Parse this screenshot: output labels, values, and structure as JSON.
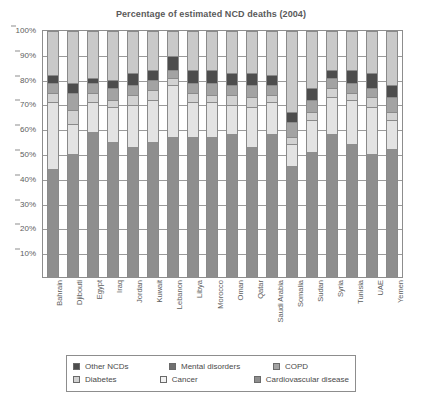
{
  "chart_data": {
    "type": "bar",
    "subtype": "stacked-percentage",
    "title": "Percentage of estimated NCD deaths (2004)",
    "xlabel": "",
    "ylabel": "",
    "ylim": [
      0,
      100
    ],
    "y_tick_labels": [
      "10%",
      "20%",
      "30%",
      "40%",
      "50%",
      "60%",
      "70%",
      "80%",
      "90%",
      "100%"
    ],
    "y_tick_values": [
      10,
      20,
      30,
      40,
      50,
      60,
      70,
      80,
      90,
      100
    ],
    "grid": true,
    "legend_position": "bottom",
    "categories": [
      "Bahrain",
      "Djibouti",
      "Egypt",
      "Iraq",
      "Jordan",
      "Kuwait",
      "Lebanon",
      "Libya",
      "Morocco",
      "Oman",
      "Qatar",
      "Saudi Arabia",
      "Somalia",
      "Sudan",
      "Syria",
      "Tunisia",
      "UAE",
      "Yemen"
    ],
    "series": [
      {
        "name": "Cardiovascular disease",
        "color": "#8e8e8e",
        "values": [
          44,
          50,
          59,
          55,
          53,
          55,
          57,
          57,
          57,
          58,
          53,
          58,
          45,
          51,
          58,
          54,
          50,
          52
        ]
      },
      {
        "name": "Cancer",
        "color": "#e3e3e3",
        "values": [
          27,
          12,
          12,
          14,
          17,
          17,
          21,
          14,
          14,
          12,
          16,
          13,
          9,
          13,
          15,
          18,
          19,
          12
        ]
      },
      {
        "name": "Diabetes",
        "color": "#d2d2d2",
        "values": [
          4,
          6,
          4,
          3,
          4,
          4,
          3,
          4,
          3,
          4,
          4,
          3,
          3,
          3,
          4,
          3,
          4,
          3
        ]
      },
      {
        "name": "COPD",
        "color": "#a3a3a3",
        "values": [
          4,
          7,
          4,
          5,
          4,
          4,
          3,
          4,
          5,
          4,
          5,
          4,
          6,
          5,
          4,
          4,
          4,
          6
        ]
      },
      {
        "name": "Mental disorders",
        "color": "#4d4d4d",
        "values": [
          3,
          4,
          2,
          3,
          5,
          4,
          6,
          5,
          5,
          5,
          5,
          4,
          4,
          5,
          3,
          5,
          6,
          5
        ]
      },
      {
        "name": "Other NCDs",
        "color": "#c9c9c9",
        "values": [
          18,
          21,
          19,
          20,
          17,
          16,
          10,
          16,
          16,
          17,
          17,
          18,
          33,
          23,
          16,
          16,
          17,
          22
        ]
      }
    ]
  },
  "legend": {
    "rows": [
      [
        {
          "label": "Other NCDs",
          "color": "#4d4d4d"
        },
        {
          "label": "Mental disorders",
          "color": "#707070"
        },
        {
          "label": "COPD",
          "color": "#a3a3a3"
        }
      ],
      [
        {
          "label": "Diabetes",
          "color": "#d2d2d2"
        },
        {
          "label": "Cancer",
          "color": "#f2f2f2"
        },
        {
          "label": "Cardiovascular disease",
          "color": "#8e8e8e"
        }
      ]
    ]
  },
  "icons": {
    "legend_swatch": "square-swatch-icon"
  }
}
